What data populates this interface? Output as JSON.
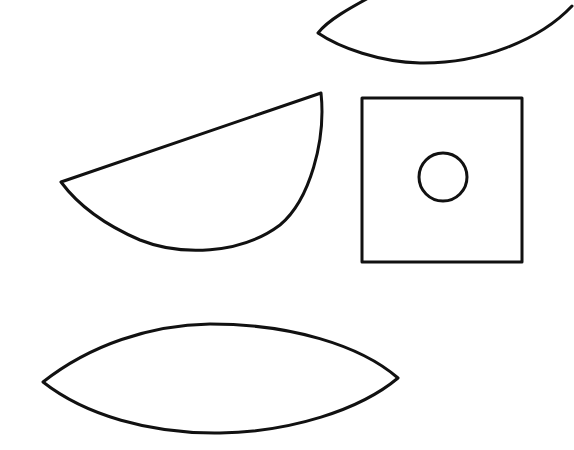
{
  "canvas": {
    "width": 574,
    "height": 450,
    "background": "#ffffff",
    "stroke_color": "#111111"
  },
  "shapes": [
    {
      "id": "lens-top-partial",
      "kind": "lens (cropped at top edge)",
      "path": "M 372 -4 C 350 8, 328 20, 318 33 C 340 48, 380 62, 420 63 C 480 64, 540 40, 572 6"
    },
    {
      "id": "half-disc",
      "kind": "circular segment",
      "path": "M 61 182 L 321 93 C 326 140, 310 200, 280 225 C 240 255, 180 256, 140 240 C 105 225, 78 205, 61 182 Z"
    },
    {
      "id": "square",
      "kind": "square",
      "x": 362,
      "y": 98,
      "w": 160,
      "h": 164
    },
    {
      "id": "circle-in-square",
      "kind": "circle",
      "cx": 443,
      "cy": 177,
      "r": 24
    },
    {
      "id": "lens-bottom",
      "kind": "lens",
      "path": "M 43 382 C 90 345, 150 325, 210 324 C 290 324, 360 345, 398 378 C 360 410, 290 432, 220 433 C 150 434, 85 415, 43 382 Z"
    }
  ]
}
